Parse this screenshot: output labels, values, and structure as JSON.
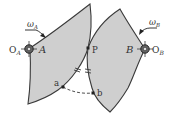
{
  "diagram": {
    "colors": {
      "body_fill": "#cfcfcf",
      "outline": "#3a3a3a",
      "text": "#333333",
      "background": "#ffffff"
    },
    "labels": {
      "omega_a": "ω",
      "omega_a_sub": "A",
      "omega_b": "ω",
      "omega_b_sub": "B",
      "pivot_a": "O",
      "pivot_a_sub": "A",
      "body_a": "A",
      "pivot_b": "O",
      "pivot_b_sub": "B",
      "body_b": "B",
      "contact_point": "P",
      "point_a": "a",
      "point_b": "b"
    }
  }
}
